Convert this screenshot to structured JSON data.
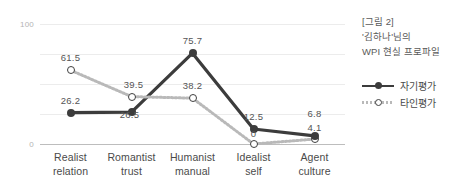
{
  "chart_data": {
    "type": "line",
    "title": "",
    "categories": [
      "Realist relation",
      "Romantist trust",
      "Humanist manual",
      "Idealist self",
      "Agent culture"
    ],
    "category_lines": [
      [
        "Realist",
        "relation"
      ],
      [
        "Romantist",
        "trust"
      ],
      [
        "Humanist",
        "manual"
      ],
      [
        "Idealist",
        "self"
      ],
      [
        "Agent",
        "culture"
      ]
    ],
    "series": [
      {
        "name": "자기평가",
        "style": "solid",
        "marker": "filled-circle",
        "color": "#3c3c3c",
        "values": [
          26.2,
          26.5,
          75.7,
          12.5,
          6.8
        ],
        "labels": [
          "26.2",
          "26.5",
          "75.7",
          "12.5",
          "6.8"
        ]
      },
      {
        "name": "타인평가",
        "style": "dotted",
        "marker": "hollow-circle",
        "color": "#b9b9b9",
        "values": [
          61.5,
          39.5,
          38.2,
          0,
          4.1
        ],
        "labels": [
          "61.5",
          "39.5",
          "38.2",
          "0",
          "4.1"
        ]
      }
    ],
    "xlabel": "",
    "ylabel": "",
    "ylim": [
      0,
      100
    ],
    "yticks": [
      0,
      100
    ],
    "ytick_labels": [
      "0",
      "100"
    ],
    "gridlines": [
      0,
      25,
      50,
      75,
      100
    ],
    "grid": true,
    "legend_position": "right"
  },
  "panel": {
    "title_lines": [
      "[그림 2]",
      "'김하나'님의",
      "WPI 현실 프로파일"
    ],
    "legend": [
      {
        "label": "자기평가"
      },
      {
        "label": "타인평가"
      }
    ]
  }
}
